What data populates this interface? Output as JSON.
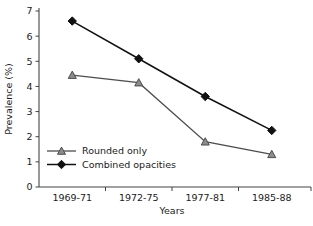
{
  "chart_data": {
    "type": "line",
    "title": "",
    "xlabel": "Years",
    "ylabel": "Prevalence (%)",
    "categories": [
      "1969-71",
      "1972-75",
      "1977-81",
      "1985-88"
    ],
    "ylim": [
      0,
      7
    ],
    "yticks": [
      0,
      1,
      2,
      3,
      4,
      5,
      6,
      7
    ],
    "ytick_labels": [
      "0",
      "1",
      "2",
      "3",
      "4",
      "5",
      "6",
      "7"
    ],
    "grid": false,
    "legend_position": "inside-lower-left",
    "series": [
      {
        "name": "Rounded only",
        "marker": "triangle",
        "color": "#8c8c8c",
        "values": [
          4.45,
          4.15,
          1.8,
          1.3
        ]
      },
      {
        "name": "Combined opacities",
        "marker": "diamond",
        "color": "#111111",
        "values": [
          6.6,
          5.1,
          3.6,
          2.25
        ]
      }
    ]
  },
  "legend": {
    "items": [
      {
        "label": "Rounded only",
        "marker": "triangle-marker"
      },
      {
        "label": "Combined opacities",
        "marker": "diamond-marker"
      }
    ]
  },
  "axes": {
    "y_title": "Prevalence (%)",
    "x_title": "Years"
  }
}
